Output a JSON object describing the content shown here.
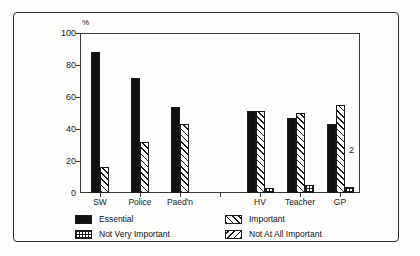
{
  "chart_data": {
    "type": "bar",
    "title": "",
    "subtitle": "",
    "xlabel": "",
    "ylabel": "%",
    "ylim": [
      0,
      100
    ],
    "yticks": [
      0,
      20,
      40,
      60,
      80,
      100
    ],
    "grid": false,
    "legend_position": "bottom",
    "categories": [
      "SW",
      "Police",
      "Paed'n",
      "",
      "HV",
      "Teacher",
      "GP"
    ],
    "series": [
      {
        "name": "Essential",
        "pattern": "solid-black",
        "values": [
          88,
          72,
          54,
          null,
          51,
          47,
          43
        ]
      },
      {
        "name": "Important",
        "pattern": "forward-hatch",
        "values": [
          16,
          32,
          43,
          null,
          51,
          50,
          55
        ]
      },
      {
        "name": "Not Very Important",
        "pattern": "grid",
        "values": [
          null,
          null,
          null,
          null,
          3,
          5,
          4
        ]
      },
      {
        "name": "Not At All Important",
        "pattern": "back-hatch",
        "values": [
          null,
          null,
          null,
          null,
          null,
          null,
          null
        ]
      }
    ],
    "annotations": [
      {
        "text": "2",
        "x_category": "GP",
        "y": 27
      }
    ]
  },
  "axis": {
    "y_unit_label": "%",
    "y_tick_labels": [
      "100",
      "80",
      "60",
      "40",
      "20",
      "0"
    ],
    "x_tick_labels": [
      "SW",
      "Police",
      "Paed'n",
      "HV",
      "Teacher",
      "GP"
    ]
  },
  "legend": {
    "entries": [
      {
        "label": "Essential",
        "pattern": "solid-black"
      },
      {
        "label": "Important",
        "pattern": "forward-hatch"
      },
      {
        "label": "Not Very Important",
        "pattern": "grid"
      },
      {
        "label": "Not At All Important",
        "pattern": "back-hatch"
      }
    ]
  },
  "colors": {
    "ink": "#111111",
    "frame": "#2b2b2b",
    "axis": "#3a3a3a",
    "background": "#fdfdfc"
  }
}
